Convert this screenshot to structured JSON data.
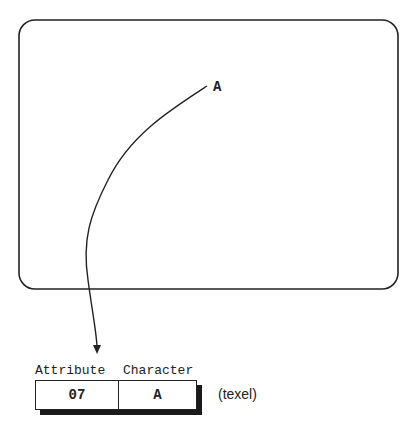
{
  "screen": {
    "character": "A"
  },
  "texel": {
    "attribute_header": "Attribute",
    "character_header": "Character",
    "attribute_value": "07",
    "character_value": "A",
    "caption": "(texel)"
  },
  "colors": {
    "stroke": "#222222",
    "shadow": "#1a1a1a",
    "background": "#ffffff"
  }
}
